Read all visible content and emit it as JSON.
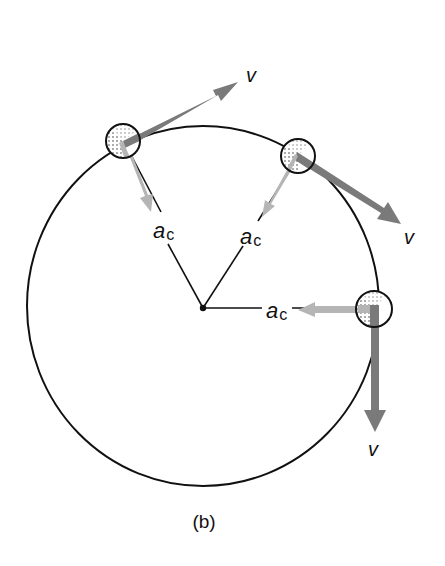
{
  "figure": {
    "caption": "(b)",
    "colors": {
      "circle": "#111111",
      "velocity_arrow": "#7a7a7a",
      "accel_arrow": "#b5b5b5",
      "radius_line": "#111111",
      "ball_stipple": "#444444"
    },
    "center": {
      "x": 203,
      "y": 308
    },
    "orbit_radius": 178,
    "bodies": [
      {
        "id": "ball-upper-left",
        "ball": {
          "x": 123,
          "y": 141,
          "r": 17
        },
        "velocity": {
          "label": "v",
          "tip": {
            "x": 238,
            "y": 82
          },
          "label_pos": {
            "x": 246,
            "y": 82
          }
        },
        "acceleration": {
          "label_main": "a",
          "label_sub": "c",
          "tip": {
            "x": 151,
            "y": 211
          },
          "label_pos": {
            "x": 153,
            "y": 238
          }
        }
      },
      {
        "id": "ball-upper-right",
        "ball": {
          "x": 298,
          "y": 156,
          "r": 17
        },
        "velocity": {
          "label": "v",
          "tip": {
            "x": 401,
            "y": 224
          },
          "label_pos": {
            "x": 404,
            "y": 244
          }
        },
        "acceleration": {
          "label_main": "a",
          "label_sub": "c",
          "tip": {
            "x": 264,
            "y": 216
          },
          "label_pos": {
            "x": 240,
            "y": 244
          }
        }
      },
      {
        "id": "ball-right",
        "ball": {
          "x": 374,
          "y": 309,
          "r": 18
        },
        "velocity": {
          "label": "v",
          "tip": {
            "x": 375,
            "y": 432
          },
          "label_pos": {
            "x": 368,
            "y": 456
          }
        },
        "acceleration": {
          "label_main": "a",
          "label_sub": "c",
          "tip": {
            "x": 298,
            "y": 311
          },
          "label_pos": {
            "x": 266,
            "y": 318
          }
        }
      }
    ]
  }
}
